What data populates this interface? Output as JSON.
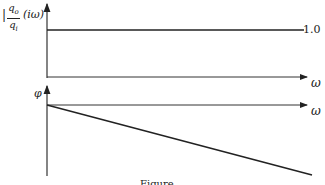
{
  "figure": {
    "magnitude_plot": {
      "ylabel_prefix": "|",
      "ylabel_numerator": "q",
      "ylabel_numerator_sub": "o",
      "ylabel_denominator": "q",
      "ylabel_denominator_sub": "i",
      "ylabel_argument": "(iω)",
      "xlabel": "ω",
      "level_label": "1.0",
      "level_value": 1.0
    },
    "phase_plot": {
      "ylabel": "φ",
      "xlabel": "ω"
    },
    "caption": "Figure"
  },
  "colors": {
    "line": "#222222",
    "axis": "#333333",
    "background": "#ffffff"
  }
}
